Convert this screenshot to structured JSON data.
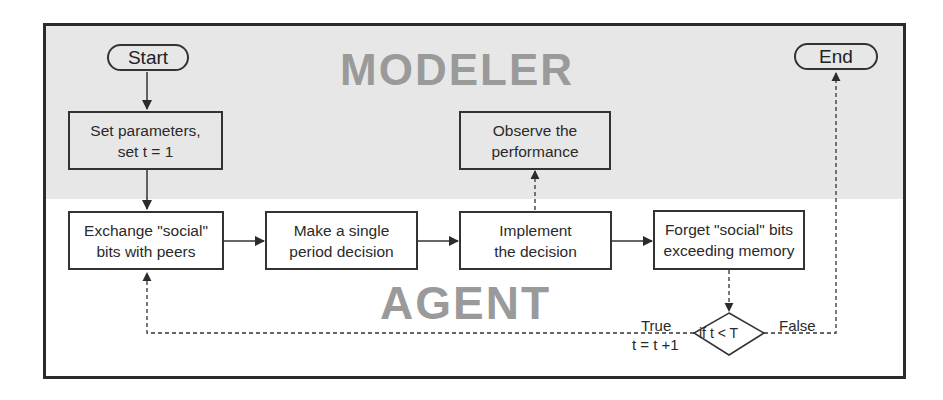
{
  "diagram": {
    "type": "flowchart",
    "regions": {
      "modeler": {
        "label": "MODELER",
        "background": "#e7e7e7"
      },
      "agent": {
        "label": "AGENT",
        "background": "#ffffff"
      }
    },
    "nodes": {
      "start": {
        "label": "Start",
        "shape": "terminal"
      },
      "end": {
        "label": "End",
        "shape": "terminal"
      },
      "set_params": {
        "line1": "Set parameters,",
        "line2": "set t = 1",
        "shape": "process",
        "region": "modeler"
      },
      "observe": {
        "line1": "Observe the",
        "line2": "performance",
        "shape": "process",
        "region": "modeler"
      },
      "exchange": {
        "line1": "Exchange \"social\"",
        "line2": "bits with peers",
        "shape": "process",
        "region": "agent"
      },
      "decide": {
        "line1": "Make a single",
        "line2": "period decision",
        "shape": "process",
        "region": "agent"
      },
      "implement": {
        "line1": "Implement",
        "line2": "the decision",
        "shape": "process",
        "region": "agent"
      },
      "forget": {
        "line1": "Forget \"social\" bits",
        "line2": "exceeding memory",
        "shape": "process",
        "region": "agent"
      },
      "condition": {
        "label": "if t < T",
        "shape": "decision",
        "region": "agent"
      }
    },
    "edges": [
      {
        "from": "start",
        "to": "set_params",
        "style": "solid"
      },
      {
        "from": "set_params",
        "to": "exchange",
        "style": "solid"
      },
      {
        "from": "exchange",
        "to": "decide",
        "style": "solid"
      },
      {
        "from": "decide",
        "to": "implement",
        "style": "solid"
      },
      {
        "from": "implement",
        "to": "forget",
        "style": "solid"
      },
      {
        "from": "implement",
        "to": "observe",
        "style": "dashed"
      },
      {
        "from": "forget",
        "to": "condition",
        "style": "dashed"
      },
      {
        "from": "condition",
        "to": "exchange",
        "style": "dashed",
        "label": "True",
        "sublabel": "t = t +1"
      },
      {
        "from": "condition",
        "to": "end",
        "style": "dashed",
        "label": "False"
      }
    ],
    "edge_labels": {
      "true": "True",
      "increment": "t = t +1",
      "false": "False"
    }
  }
}
